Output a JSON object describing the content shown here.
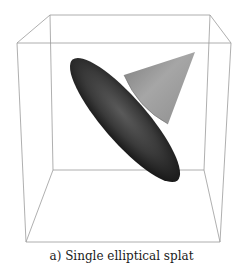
{
  "caption": "a) Single elliptical splat",
  "scene": {
    "objects": [
      {
        "name": "bounding-cube",
        "type": "wireframe-cube",
        "color": "#9a9a9a"
      },
      {
        "name": "elliptical-splat",
        "type": "ellipse",
        "color": "#2a2a2a"
      },
      {
        "name": "cone",
        "type": "cone",
        "color": "#8a8a8a"
      }
    ]
  },
  "colors": {
    "background": "#ffffff",
    "cube_edges": "#9a9a9a",
    "splat_dark": "#1e1e1e",
    "splat_mid": "#4a4a4a",
    "cone_light": "#b0b0b0",
    "cone_dark": "#6a6a6a"
  }
}
